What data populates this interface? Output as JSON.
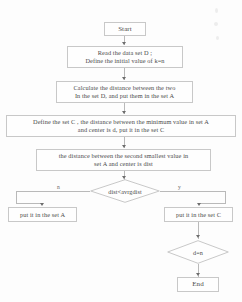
{
  "diagram": {
    "nodes": {
      "start": {
        "label": "Start",
        "shape": "terminal"
      },
      "read_data": {
        "label": "Read the data set D ;\nDefine the initial value of k=n",
        "shape": "process"
      },
      "calculate": {
        "label": "Calculate the distance between the two\nIn the set D, and put them in the set A",
        "shape": "process"
      },
      "define_set_c": {
        "label": "Define the set C , the distance between the minimum value in set A\nand center is d, put it in the set C",
        "shape": "process"
      },
      "second_smallest": {
        "label": "the distance between the second smallest value in\nset A and center is dist",
        "shape": "process"
      },
      "decision_dist": {
        "label": "dist<avrgdist",
        "shape": "decision"
      },
      "put_set_a": {
        "label": "put it in the set A",
        "shape": "process"
      },
      "put_set_c": {
        "label": "put it in the set C",
        "shape": "process"
      },
      "decision_dn": {
        "label": "d=n",
        "shape": "decision"
      },
      "end": {
        "label": "End",
        "shape": "terminal"
      }
    },
    "branches": {
      "decision_dist_no": "n",
      "decision_dist_yes": "y"
    },
    "colors": {
      "stroke": "#c8c8c8",
      "connector": "#b9b9b9",
      "arrow": "#6d6d6d",
      "text": "#4a4a4a",
      "background": "#fdfdfd"
    }
  }
}
